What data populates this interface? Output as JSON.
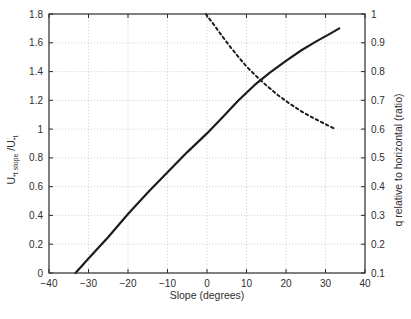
{
  "figure": {
    "background": "#ffffff"
  },
  "chart_data": {
    "type": "line",
    "title": "",
    "xlabel": "Slope (degrees)",
    "ylabel_left": {
      "base1": "U",
      "sub1": "*t slope",
      "base2": " /U",
      "sub2": "*t",
      "plain": "U*t slope/U*t"
    },
    "ylabel_right": "q relative to horizontal (ratio)",
    "x_range": [
      -40,
      40
    ],
    "y_left_range": [
      0,
      1.8
    ],
    "y_right_range": [
      0.1,
      1
    ],
    "grid": true,
    "legend": "none",
    "colors": {
      "line": "#1c1c1c",
      "grid": "#c9c9c9",
      "axis": "#2a2a2a",
      "text": "#2e2e2e"
    },
    "x_ticks": {
      "values": [
        -40,
        -30,
        -20,
        -10,
        0,
        10,
        20,
        30,
        40
      ],
      "labels": [
        "−40",
        "−30",
        "−20",
        "−10",
        "0",
        "10",
        "20",
        "30",
        "40"
      ]
    },
    "y_left_ticks": {
      "values": [
        0,
        0.2,
        0.4,
        0.6,
        0.8,
        1.0,
        1.2,
        1.4,
        1.6,
        1.8
      ],
      "labels": [
        "0",
        "0.2",
        "0.4",
        "0.6",
        "0.8",
        "1",
        "1.2",
        "1.4",
        "1.6",
        "1.8"
      ]
    },
    "y_right_ticks": {
      "values": [
        0.1,
        0.2,
        0.3,
        0.4,
        0.5,
        0.6,
        0.7,
        0.8,
        0.9,
        1.0
      ],
      "labels": [
        "0.1",
        "0.2",
        "0.3",
        "0.4",
        "0.5",
        "0.6",
        "0.7",
        "0.8",
        "0.9",
        "1"
      ]
    },
    "series": [
      {
        "name": "U*t slope/U*t threshold velocity ratio",
        "axis": "left",
        "line_style": "solid",
        "color": "#1c1c1c",
        "x": [
          -33.3,
          -30,
          -25,
          -20,
          -15,
          -10,
          -5,
          0,
          4,
          8,
          12,
          16,
          20,
          24,
          28,
          31,
          33.5
        ],
        "y": [
          0,
          0.1,
          0.25,
          0.41,
          0.56,
          0.7,
          0.84,
          0.97,
          1.085,
          1.2,
          1.305,
          1.395,
          1.475,
          1.55,
          1.615,
          1.66,
          1.7
        ]
      },
      {
        "name": "q relative to horizontal ratio",
        "axis": "right",
        "line_style": "dashed",
        "color": "#1c1c1c",
        "x": [
          -0.3,
          2,
          4,
          6,
          8,
          10,
          12,
          15,
          18,
          21,
          24,
          27,
          30,
          32.5
        ],
        "y": [
          1.0,
          0.958,
          0.92,
          0.884,
          0.85,
          0.818,
          0.79,
          0.752,
          0.718,
          0.688,
          0.661,
          0.638,
          0.617,
          0.6
        ]
      }
    ]
  }
}
